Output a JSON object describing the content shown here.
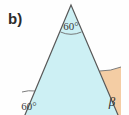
{
  "figure": {
    "part_label": "b)",
    "shape": "triangle",
    "colors": {
      "triangle_fill": "#cdf0f4",
      "beta_sector_fill": "#f4cda4",
      "edge_stroke": "#585858",
      "arc_stroke": "#6d6d6d",
      "text": "#2b2b2b",
      "background": "#fefefe"
    },
    "vertices": {
      "apex": {
        "x": 71,
        "y": 5
      },
      "bottom_left": {
        "x": 22,
        "y": 122
      },
      "bottom_right": {
        "x": 121,
        "y": 122
      }
    },
    "angles": [
      {
        "name": "apex-angle",
        "label": "60°",
        "position": "apex",
        "marked": true,
        "sector_filled": false
      },
      {
        "name": "bottom-left-angle",
        "label": "60°",
        "position": "bottom-left",
        "marked": true,
        "sector_filled": false
      },
      {
        "name": "bottom-right-angle",
        "label": "β",
        "position": "bottom-right",
        "marked": true,
        "sector_filled": true
      }
    ]
  }
}
